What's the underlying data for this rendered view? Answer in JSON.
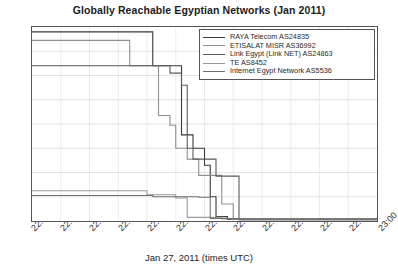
{
  "chart_data": {
    "type": "line",
    "title": "Globally Reachable Egyptian Networks (Jan 2011)",
    "xlabel": "Jan 27, 2011 (times UTC)",
    "ylabel": "",
    "xlim": [
      0,
      60
    ],
    "ylim": [
      0,
      800
    ],
    "grid": true,
    "legend_position": "top-right",
    "xtick_labels": [
      "22:00",
      "22:05",
      "22:10",
      "22:15",
      "22:20",
      "22:25",
      "22:30",
      "22:35",
      "22:40",
      "22:45",
      "22:50",
      "22:55",
      "23:00"
    ],
    "xtick_values": [
      0,
      5,
      10,
      15,
      20,
      25,
      30,
      35,
      40,
      45,
      50,
      55,
      60
    ],
    "ytick_labels": [
      "0",
      "100",
      "200",
      "300",
      "400",
      "500",
      "600",
      "700",
      "800"
    ],
    "ytick_values": [
      0,
      100,
      200,
      300,
      400,
      500,
      600,
      700,
      800
    ],
    "series": [
      {
        "name": "RAYA Telecom AS24835",
        "color": "#3a3a3a",
        "points": [
          [
            0,
            780
          ],
          [
            21,
            780
          ],
          [
            21,
            640
          ],
          [
            26,
            640
          ],
          [
            26,
            355
          ],
          [
            28,
            355
          ],
          [
            28,
            300
          ],
          [
            30,
            300
          ],
          [
            30,
            230
          ],
          [
            31,
            230
          ],
          [
            31,
            100
          ],
          [
            32,
            100
          ],
          [
            32,
            18
          ],
          [
            34,
            18
          ],
          [
            34,
            6
          ],
          [
            60,
            6
          ]
        ]
      },
      {
        "name": "ETISALAT MISR AS36992",
        "color": "#8f8f8f",
        "points": [
          [
            0,
            745
          ],
          [
            17,
            745
          ],
          [
            17,
            640
          ],
          [
            22,
            640
          ],
          [
            22,
            435
          ],
          [
            24,
            435
          ],
          [
            24,
            395
          ],
          [
            25,
            395
          ],
          [
            25,
            300
          ],
          [
            27,
            300
          ],
          [
            27,
            255
          ],
          [
            29,
            255
          ],
          [
            29,
            188
          ],
          [
            33,
            188
          ],
          [
            33,
            70
          ],
          [
            35,
            70
          ],
          [
            35,
            8
          ],
          [
            60,
            8
          ]
        ]
      },
      {
        "name": "Link Egypt (Link NET) AS24863",
        "color": "#5a5a5a",
        "points": [
          [
            0,
            640
          ],
          [
            24,
            640
          ],
          [
            24,
            610
          ],
          [
            26,
            610
          ],
          [
            26,
            560
          ],
          [
            27,
            560
          ],
          [
            27,
            300
          ],
          [
            28,
            300
          ],
          [
            28,
            255
          ],
          [
            32,
            255
          ],
          [
            32,
            185
          ],
          [
            36,
            185
          ],
          [
            36,
            10
          ],
          [
            60,
            10
          ]
        ]
      },
      {
        "name": "TE AS8452",
        "color": "#9a9a9a",
        "points": [
          [
            0,
            125
          ],
          [
            20,
            125
          ],
          [
            20,
            108
          ],
          [
            25,
            108
          ],
          [
            25,
            95
          ],
          [
            27,
            95
          ],
          [
            27,
            15
          ],
          [
            33,
            15
          ],
          [
            33,
            8
          ],
          [
            60,
            8
          ]
        ]
      },
      {
        "name": "Internet Egypt Network AS5536",
        "color": "#707070",
        "points": [
          [
            0,
            105
          ],
          [
            21,
            105
          ],
          [
            21,
            100
          ],
          [
            29,
            100
          ],
          [
            29,
            98
          ],
          [
            31,
            98
          ],
          [
            31,
            10
          ],
          [
            36,
            10
          ],
          [
            36,
            4
          ],
          [
            60,
            4
          ]
        ]
      }
    ]
  }
}
